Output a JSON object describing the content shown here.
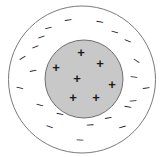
{
  "figure": {
    "type": "physics-charge-diagram",
    "title": "",
    "caption": "",
    "canvas": {
      "width": 168,
      "height": 157,
      "background": "#ffffff"
    }
  },
  "colors": {
    "outline": "#7a7a7a",
    "inner_fill": "#c8c8c8",
    "inner_outline": "#6e6e6e",
    "symbol": "#1a1a1a",
    "background": "#ffffff"
  },
  "shapes": {
    "outer_circle": {
      "name": "outer-boundary-circle",
      "cx": 82,
      "cy": 79.5,
      "r": 73.5,
      "fill": "none",
      "stroke": "#7a7a7a",
      "stroke_width": 1
    },
    "inner_circle": {
      "name": "inner-charged-sphere",
      "cx": 84,
      "cy": 79,
      "r": 39,
      "fill": "#c8c8c8",
      "stroke": "#6e6e6e",
      "stroke_width": 1
    }
  },
  "charges": {
    "positive_symbol": "+",
    "negative_symbol": "–",
    "positive_count": 7,
    "negative_count": 22,
    "positive": [
      {
        "id": "pos-1",
        "x": 81,
        "y": 52
      },
      {
        "id": "pos-2",
        "x": 100,
        "y": 63
      },
      {
        "id": "pos-3",
        "x": 56,
        "y": 67
      },
      {
        "id": "pos-4",
        "x": 77,
        "y": 78
      },
      {
        "id": "pos-5",
        "x": 112,
        "y": 84
      },
      {
        "id": "pos-6",
        "x": 73,
        "y": 97
      },
      {
        "id": "pos-7",
        "x": 96,
        "y": 97
      }
    ],
    "negative": [
      {
        "id": "neg-1",
        "x": 68,
        "y": 19,
        "rot": -8
      },
      {
        "id": "neg-2",
        "x": 100,
        "y": 21,
        "rot": 10
      },
      {
        "id": "neg-3",
        "x": 48,
        "y": 27,
        "rot": -14
      },
      {
        "id": "neg-4",
        "x": 115,
        "y": 31,
        "rot": 16
      },
      {
        "id": "neg-5",
        "x": 41,
        "y": 36,
        "rot": -20
      },
      {
        "id": "neg-6",
        "x": 128,
        "y": 40,
        "rot": 22
      },
      {
        "id": "neg-7",
        "x": 35,
        "y": 46,
        "rot": -24
      },
      {
        "id": "neg-8",
        "x": 22,
        "y": 57,
        "rot": -32
      },
      {
        "id": "neg-9",
        "x": 137,
        "y": 60,
        "rot": 34
      },
      {
        "id": "neg-10",
        "x": 33,
        "y": 70,
        "rot": -12
      },
      {
        "id": "neg-11",
        "x": 134,
        "y": 76,
        "rot": 6
      },
      {
        "id": "neg-12",
        "x": 20,
        "y": 87,
        "rot": 14
      },
      {
        "id": "neg-13",
        "x": 146,
        "y": 87,
        "rot": -8
      },
      {
        "id": "neg-14",
        "x": 133,
        "y": 100,
        "rot": -6
      },
      {
        "id": "neg-15",
        "x": 40,
        "y": 104,
        "rot": 16
      },
      {
        "id": "neg-16",
        "x": 128,
        "y": 106,
        "rot": 10
      },
      {
        "id": "neg-17",
        "x": 50,
        "y": 126,
        "rot": 20
      },
      {
        "id": "neg-18",
        "x": 90,
        "y": 124,
        "rot": -4
      },
      {
        "id": "neg-19",
        "x": 122,
        "y": 126,
        "rot": -16
      },
      {
        "id": "neg-20",
        "x": 80,
        "y": 139,
        "rot": 2
      },
      {
        "id": "neg-21",
        "x": 60,
        "y": 113,
        "rot": 12
      },
      {
        "id": "neg-22",
        "x": 108,
        "y": 117,
        "rot": -10
      }
    ]
  },
  "typography": {
    "positive_font_size": 13,
    "negative_font_size": 12
  }
}
